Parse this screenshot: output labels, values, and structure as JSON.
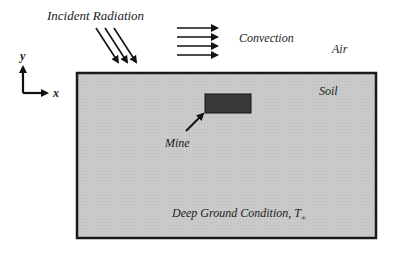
{
  "labels": {
    "incident_radiation": "Incident Radiation",
    "convection": "Convection",
    "air": "Air",
    "soil": "Soil",
    "mine": "Mine",
    "deep_ground": "Deep Ground Condition, T",
    "deep_ground_sub": "∞",
    "axis_x": "x",
    "axis_y": "y"
  },
  "colors": {
    "soil_fill": "#c9c9c9",
    "soil_border": "#1a1a1a",
    "mine_fill": "#3a3a3a",
    "arrow": "#111111"
  }
}
